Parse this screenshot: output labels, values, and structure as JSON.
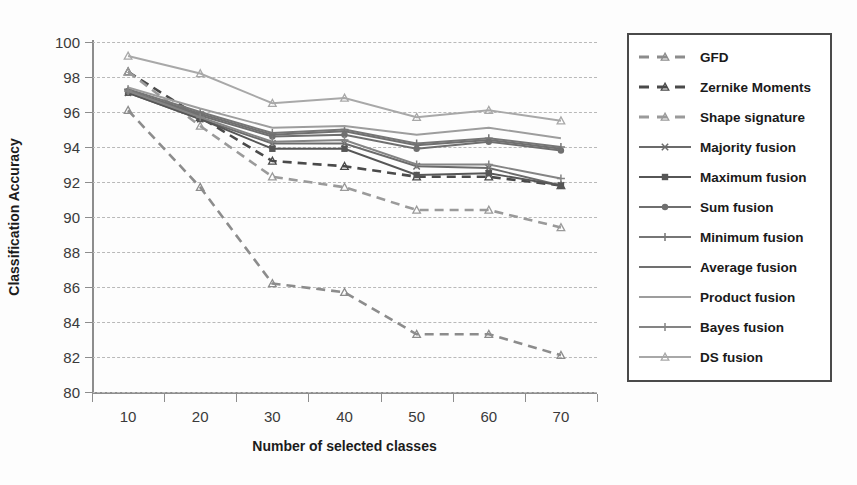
{
  "chart_data": {
    "type": "line",
    "title": "",
    "xlabel": "Number of selected classes",
    "ylabel": "Classification Accuracy",
    "x": [
      10,
      20,
      30,
      40,
      50,
      60,
      70
    ],
    "xtick_labels": [
      "10",
      "20",
      "30",
      "40",
      "50",
      "60",
      "70"
    ],
    "ytick_labels": [
      "100",
      "98",
      "96",
      "94",
      "92",
      "90",
      "88",
      "86",
      "84",
      "82",
      "80"
    ],
    "xlim": [
      5,
      75
    ],
    "ylim": [
      80,
      100
    ],
    "grid": "horizontal-dashed",
    "legend_position": "right-outside",
    "series": [
      {
        "name": "GFD",
        "style": "dashed",
        "marker": "triangle",
        "color": "#8c8c8c",
        "values": [
          96.1,
          91.7,
          86.2,
          85.7,
          83.3,
          83.3,
          82.1
        ]
      },
      {
        "name": "Zernike Moments",
        "style": "dashed",
        "marker": "triangle",
        "color": "#4a4a4a",
        "values": [
          98.3,
          95.7,
          93.2,
          92.9,
          92.3,
          92.3,
          91.8
        ]
      },
      {
        "name": "Shape signature",
        "style": "dashed",
        "marker": "triangle",
        "color": "#9a9a9a",
        "values": [
          98.3,
          95.2,
          92.3,
          91.7,
          90.4,
          90.4,
          89.4
        ]
      },
      {
        "name": "Majority fusion",
        "style": "solid",
        "marker": "x",
        "color": "#6b6b6b",
        "values": [
          97.1,
          95.6,
          94.2,
          94.2,
          92.9,
          92.8,
          91.8
        ]
      },
      {
        "name": "Maximum fusion",
        "style": "solid",
        "marker": "square",
        "color": "#565656",
        "values": [
          97.1,
          95.6,
          93.9,
          93.9,
          92.4,
          92.5,
          91.8
        ]
      },
      {
        "name": "Sum fusion",
        "style": "solid",
        "marker": "circle",
        "color": "#6f6f6f",
        "values": [
          97.2,
          95.8,
          94.6,
          94.7,
          93.9,
          94.3,
          93.8
        ]
      },
      {
        "name": "Minimum fusion",
        "style": "solid",
        "marker": "plus",
        "color": "#767676",
        "values": [
          97.3,
          96.0,
          94.8,
          95.0,
          94.2,
          94.5,
          94.0
        ]
      },
      {
        "name": "Average fusion",
        "style": "solid",
        "marker": "none",
        "color": "#707070",
        "values": [
          97.2,
          95.9,
          94.7,
          94.9,
          94.1,
          94.4,
          93.9
        ]
      },
      {
        "name": "Product fusion",
        "style": "solid",
        "marker": "none",
        "color": "#9d9d9d",
        "values": [
          97.4,
          96.2,
          95.1,
          95.2,
          94.7,
          95.1,
          94.5
        ]
      },
      {
        "name": "Bayes fusion",
        "style": "solid",
        "marker": "plus",
        "color": "#848484",
        "values": [
          97.2,
          95.7,
          94.3,
          94.4,
          93.0,
          93.0,
          92.2
        ]
      },
      {
        "name": "DS fusion",
        "style": "solid",
        "marker": "triangle",
        "color": "#a8a8a8",
        "values": [
          99.2,
          98.2,
          96.5,
          96.8,
          95.7,
          96.1,
          95.5
        ]
      }
    ]
  }
}
